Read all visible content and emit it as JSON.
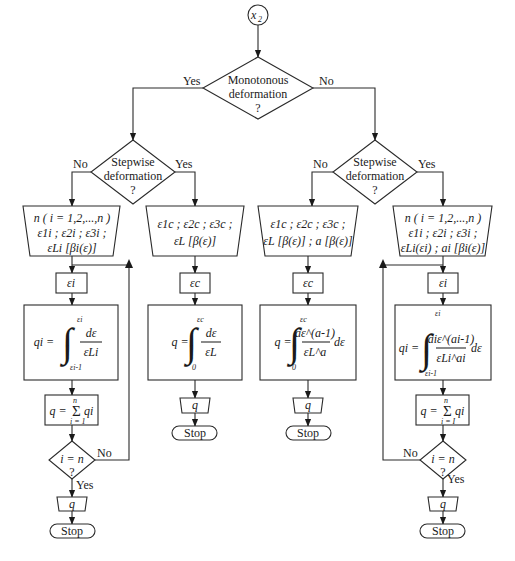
{
  "start": {
    "label": "x",
    "sub": "2"
  },
  "decisions": {
    "monotonous": {
      "line1": "Monotonous",
      "line2": "deformation",
      "line3": "?",
      "yes": "Yes",
      "no": "No"
    },
    "stepwise_left": {
      "line1": "Stepwise",
      "line2": "deformation",
      "line3": "?",
      "yes": "Yes",
      "no": "No"
    },
    "stepwise_right": {
      "line1": "Stepwise",
      "line2": "deformation",
      "line3": "?",
      "yes": "Yes",
      "no": "No"
    },
    "loop_left": {
      "line1": "i = n",
      "line2": "?",
      "yes": "Yes",
      "no": "No"
    },
    "loop_right": {
      "line1": "i = n",
      "line2": "?",
      "yes": "Yes",
      "no": "No"
    }
  },
  "columns": [
    {
      "id": "monotonous-stepwise",
      "input": {
        "line1": "n ( i = 1,2,...,n )",
        "line2": "ε1i ; ε2i ; ε3i ;",
        "line3": "εLi [βi(ε)]"
      },
      "var": "εi",
      "formula": {
        "lhs": "qi =",
        "upper": "εi",
        "lower": "εi-1",
        "num": "dε",
        "den": "εLi"
      },
      "sum": {
        "lhs": "q =",
        "upper": "n",
        "lower": "i = 1",
        "term": "qi"
      },
      "output": "q",
      "stop": "Stop"
    },
    {
      "id": "monotonous-continuous",
      "input": {
        "line1": "ε1c ; ε2c ; ε3c ;",
        "line2": "εL [β(ε)]"
      },
      "var": "εc",
      "formula": {
        "lhs": "q =",
        "upper": "εc",
        "lower": "0",
        "num": "dε",
        "den": "εL"
      },
      "output": "q",
      "stop": "Stop"
    },
    {
      "id": "nonmonotonous-continuous",
      "input": {
        "line1": "ε1c ; ε2c ; ε3c ;",
        "line2": "εL [β(ε)] ; a [β(ε)]"
      },
      "var": "εc",
      "formula": {
        "lhs": "q =",
        "upper": "εc",
        "lower": "0",
        "num": "aε^(a-1)",
        "den": "εL^a",
        "tail": "dε"
      },
      "output": "q",
      "stop": "Stop"
    },
    {
      "id": "nonmonotonous-stepwise",
      "input": {
        "line1": "n ( i = 1,2,...,n )",
        "line2": "ε1i ; ε2i ; ε3i ;",
        "line3": "εLi(εi) ; ai [βi(ε)]"
      },
      "var": "εi",
      "formula": {
        "lhs": "qi =",
        "upper": "εi",
        "lower": "εi-1",
        "num": "aiε^(ai-1)",
        "den": "εLi^ai",
        "tail": "dε"
      },
      "sum": {
        "lhs": "q =",
        "upper": "n",
        "lower": "i = I",
        "term": "qi"
      },
      "output": "q",
      "stop": "Stop"
    }
  ]
}
